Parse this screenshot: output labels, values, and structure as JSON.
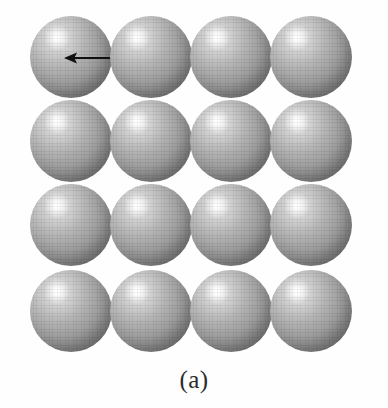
{
  "figure": {
    "caption": "(a)",
    "background_color": "#fefefe",
    "width": 388,
    "height": 408
  },
  "sphere_grid": {
    "rows": 4,
    "columns": 4,
    "sphere_diameter": 82,
    "column_centers": [
      41,
      121,
      201,
      281
    ],
    "row_centers": [
      41,
      125,
      209,
      295
    ],
    "fill_color": "#9a9a9a",
    "highlight_color": "#ffffff",
    "shadow_color": "#6e6e6e",
    "spheres": [
      {
        "row": 0,
        "col": 0,
        "x": 0,
        "y": 0
      },
      {
        "row": 0,
        "col": 1,
        "x": 80,
        "y": 0
      },
      {
        "row": 0,
        "col": 2,
        "x": 160,
        "y": 0
      },
      {
        "row": 0,
        "col": 3,
        "x": 240,
        "y": 0
      },
      {
        "row": 1,
        "col": 0,
        "x": 0,
        "y": 84
      },
      {
        "row": 1,
        "col": 1,
        "x": 80,
        "y": 84
      },
      {
        "row": 1,
        "col": 2,
        "x": 160,
        "y": 84
      },
      {
        "row": 1,
        "col": 3,
        "x": 240,
        "y": 84
      },
      {
        "row": 2,
        "col": 0,
        "x": 0,
        "y": 168
      },
      {
        "row": 2,
        "col": 1,
        "x": 80,
        "y": 168
      },
      {
        "row": 2,
        "col": 2,
        "x": 160,
        "y": 168
      },
      {
        "row": 2,
        "col": 3,
        "x": 240,
        "y": 168
      },
      {
        "row": 3,
        "col": 0,
        "x": 0,
        "y": 254
      },
      {
        "row": 3,
        "col": 1,
        "x": 80,
        "y": 254
      },
      {
        "row": 3,
        "col": 2,
        "x": 160,
        "y": 254
      },
      {
        "row": 3,
        "col": 3,
        "x": 240,
        "y": 254
      }
    ]
  },
  "arrow": {
    "label": "",
    "style": "double-headed",
    "color": "#101010",
    "x1": 64,
    "x2": 152,
    "y": 58,
    "line_width": 2.2,
    "head_length": 13,
    "head_half_width": 5.5
  }
}
